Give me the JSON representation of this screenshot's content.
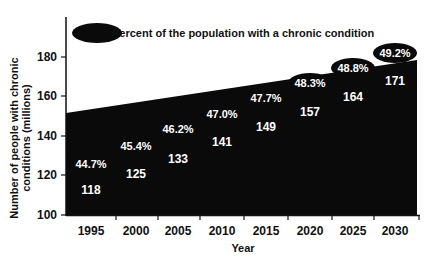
{
  "chart_data": {
    "type": "area",
    "title": "",
    "xlabel": "Year",
    "ylabel": "Number of people with chronic conditions (millions)",
    "ylabel_lines": [
      "Number of people with chronic",
      "conditions (millions)"
    ],
    "categories": [
      "1995",
      "2000",
      "2005",
      "2010",
      "2015",
      "2020",
      "2025",
      "2030"
    ],
    "series": [
      {
        "name": "Number of people with chronic conditions (millions)",
        "values": [
          118,
          125,
          133,
          141,
          149,
          157,
          164,
          171
        ],
        "labels": [
          "118",
          "125",
          "133",
          "141",
          "149",
          "157",
          "164",
          "171"
        ]
      },
      {
        "name": "Percent of the population with a chronic condition",
        "values": [
          44.7,
          45.4,
          46.2,
          47.0,
          47.7,
          48.3,
          48.8,
          49.2
        ],
        "labels": [
          "44.7%",
          "45.4%",
          "46.2%",
          "47.0%",
          "47.7%",
          "48.3%",
          "48.8%",
          "49.2%"
        ]
      }
    ],
    "legend": {
      "entries": [
        "Percent of the population with a chronic condition"
      ],
      "position": "top-left"
    },
    "yticks": [
      "100",
      "120",
      "140",
      "160",
      "180"
    ],
    "ylim": [
      100,
      190
    ],
    "grid": false,
    "colors": {
      "fill": "#0a0a0a",
      "badge": "#0a0a0a",
      "badge_text": "#ffffff"
    }
  }
}
